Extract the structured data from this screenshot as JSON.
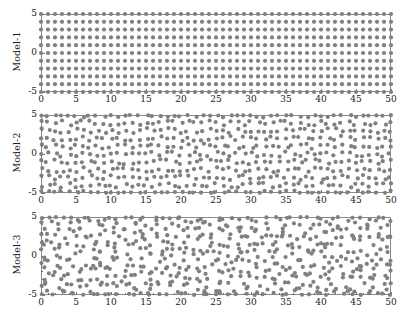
{
  "figure": {
    "width": 410,
    "height": 323,
    "background": "#ffffff",
    "marker_color": "#808080",
    "frame_color": "#8a8a8a",
    "text_color": "#1a1a1a"
  },
  "chart_data": {
    "type": "scatter",
    "title": "",
    "xlabel": "",
    "ylabel": "",
    "grid": false,
    "legend": null,
    "shared_x": {
      "xlim": [
        0,
        50
      ],
      "xticks": [
        0,
        5,
        10,
        15,
        20,
        25,
        30,
        35,
        40,
        45,
        50
      ],
      "xticklabels": [
        "0",
        "5",
        "10",
        "15",
        "20",
        "25",
        "30",
        "35",
        "40",
        "45",
        "50"
      ],
      "minor_xtick_step": 1
    },
    "shared_y": {
      "ylim": [
        -5,
        5
      ],
      "yticks": [
        -5,
        0,
        5
      ],
      "yticklabels": [
        "-5",
        "0",
        "5"
      ],
      "minor_ytick_step": 1
    },
    "panels": [
      {
        "name": "Model-1",
        "ylabel": "Model-1",
        "description": "regular square lattice of points, spacing 1 unit in x and y",
        "lattice": {
          "nx": 51,
          "ny": 11,
          "x0": 0,
          "y0": -5,
          "dx": 1,
          "dy": 1
        },
        "jitter": {
          "x": 0.0,
          "y": 0.0
        },
        "point_count": 561,
        "marker": {
          "shape": "circle",
          "size_px": 2.1,
          "color": "#808080"
        }
      },
      {
        "name": "Model-2",
        "ylabel": "Model-2",
        "description": "square lattice with moderate random positional disorder",
        "lattice": {
          "nx": 51,
          "ny": 11,
          "x0": 0,
          "y0": -5,
          "dx": 1,
          "dy": 1
        },
        "jitter": {
          "x": 0.33,
          "y": 0.33
        },
        "point_count": 561,
        "marker": {
          "shape": "circle",
          "size_px": 2.1,
          "color": "#808080"
        }
      },
      {
        "name": "Model-3",
        "ylabel": "Model-3",
        "description": "square lattice with strong random positional disorder",
        "lattice": {
          "nx": 51,
          "ny": 11,
          "x0": 0,
          "y0": -5,
          "dx": 1,
          "dy": 1
        },
        "jitter": {
          "x": 0.62,
          "y": 0.62
        },
        "point_count": 561,
        "marker": {
          "shape": "circle",
          "size_px": 2.1,
          "color": "#808080"
        }
      }
    ]
  },
  "geometry": {
    "plot_left": 41,
    "plot_right": 391,
    "panel_tops": [
      14,
      115,
      217
    ],
    "panel_height": 78
  }
}
